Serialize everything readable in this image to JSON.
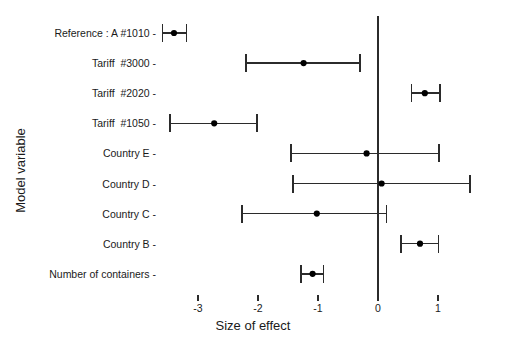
{
  "chart_data": {
    "type": "scatter",
    "subtype": "forest-plot",
    "title": "",
    "xlabel": "Size of effect",
    "ylabel": "Model variable",
    "xlim": [
      -3.75,
      1.72
    ],
    "xticks": [
      -3,
      -2,
      -1,
      0,
      1
    ],
    "xtick_labels": [
      "-3",
      "-2",
      "-1",
      "0",
      "1"
    ],
    "grid": false,
    "legend": null,
    "reference_line_x": 0,
    "marker_color": "#000000",
    "line_color": "#2b2b2b",
    "background_color": "#ffffff",
    "categories": [
      "Reference : A #1010",
      "Tariff  #3000",
      "Tariff  #2020",
      "Tariff  #1050",
      "Country E",
      "Country D",
      "Country C",
      "Country B",
      "Number of containers"
    ],
    "points": [
      {
        "label": "Reference : A #1010",
        "estimate": -3.4,
        "ci_low": -3.59,
        "ci_high": -3.19
      },
      {
        "label": "Tariff  #3000",
        "estimate": -1.24,
        "ci_low": -2.2,
        "ci_high": -0.3
      },
      {
        "label": "Tariff  #2020",
        "estimate": 0.78,
        "ci_low": 0.56,
        "ci_high": 1.03
      },
      {
        "label": "Tariff  #1050",
        "estimate": -2.73,
        "ci_low": -3.47,
        "ci_high": -2.02
      },
      {
        "label": "Country E",
        "estimate": -0.19,
        "ci_low": -1.45,
        "ci_high": 1.02
      },
      {
        "label": "Country D",
        "estimate": 0.06,
        "ci_low": -1.42,
        "ci_high": 1.53
      },
      {
        "label": "Country C",
        "estimate": -1.02,
        "ci_low": -2.27,
        "ci_high": 0.14
      },
      {
        "label": "Country B",
        "estimate": 0.7,
        "ci_low": 0.38,
        "ci_high": 1.01
      },
      {
        "label": "Number of containers",
        "estimate": -1.09,
        "ci_low": -1.28,
        "ci_high": -0.91
      }
    ]
  }
}
